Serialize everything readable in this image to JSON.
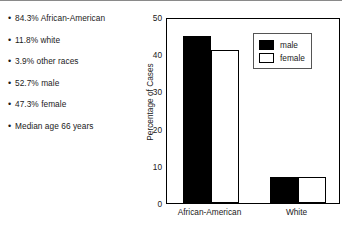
{
  "bullets": [
    {
      "text": "84.3% African-American"
    },
    {
      "text": "11.8% white"
    },
    {
      "text": "3.9% other races"
    },
    {
      "text": "52.7% male"
    },
    {
      "text": "47.3% female"
    },
    {
      "text": "Median age 66 years"
    }
  ],
  "bullet_marker": "•",
  "chart_data": {
    "type": "bar",
    "title": "",
    "xlabel": "",
    "ylabel": "Percentage of Cases",
    "categories": [
      "African-American",
      "White"
    ],
    "series": [
      {
        "name": "male",
        "values": [
          45,
          7
        ],
        "color": "#000000"
      },
      {
        "name": "female",
        "values": [
          41,
          7
        ],
        "color": "#ffffff"
      }
    ],
    "ylim": [
      0,
      50
    ],
    "yticks": [
      0,
      10,
      20,
      30,
      40,
      50
    ],
    "ytick_labels": [
      "0",
      "10",
      "20",
      "30",
      "40",
      "50"
    ],
    "grid": false,
    "legend_position": "top-right",
    "legend_entries": [
      "male",
      "female"
    ]
  }
}
